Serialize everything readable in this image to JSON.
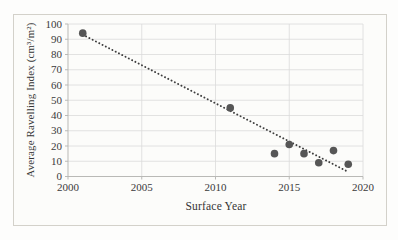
{
  "figure": {
    "background": "#fcfcfa",
    "border_color": "#d3d1ca"
  },
  "chart_data": {
    "type": "scatter",
    "title": "",
    "xlabel": "Surface Year",
    "ylabel": "Average Ravelling Index (cm³/m²)",
    "xlim": [
      2000,
      2020
    ],
    "ylim": [
      0,
      100
    ],
    "x_ticks": [
      "2000",
      "2005",
      "2010",
      "2015",
      "2020"
    ],
    "x_tick_values": [
      2000,
      2005,
      2010,
      2015,
      2020
    ],
    "y_ticks": [
      "0",
      "10",
      "20",
      "30",
      "40",
      "50",
      "60",
      "70",
      "80",
      "90",
      "100"
    ],
    "y_tick_values": [
      0,
      10,
      20,
      30,
      40,
      50,
      60,
      70,
      80,
      90,
      100
    ],
    "grid": true,
    "legend": "none",
    "points": [
      {
        "x": 2001,
        "y": 94
      },
      {
        "x": 2011,
        "y": 45
      },
      {
        "x": 2014,
        "y": 15
      },
      {
        "x": 2015,
        "y": 21
      },
      {
        "x": 2016,
        "y": 15
      },
      {
        "x": 2017,
        "y": 9
      },
      {
        "x": 2018,
        "y": 17
      },
      {
        "x": 2019,
        "y": 8
      }
    ],
    "trendline": {
      "style": "dotted",
      "x1": 2001,
      "y1": 93,
      "x2": 2019,
      "y2": 3
    },
    "colors": {
      "point": "#565656",
      "trendline": "#3e3e3e",
      "gridline": "#dadada",
      "axis_line": "#b9b9b6",
      "tick_text": "#3a3a3a"
    }
  }
}
